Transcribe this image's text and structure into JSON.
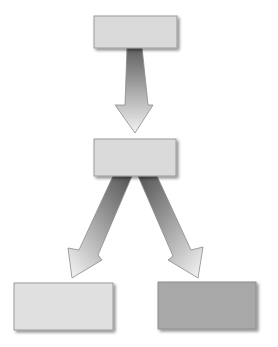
{
  "diagram": {
    "type": "hierarchy-flow",
    "background": "#ffffff",
    "nodes": [
      {
        "id": "top",
        "label": "",
        "x": 94,
        "y": 16,
        "w": 83,
        "h": 32,
        "fill": "#dadada"
      },
      {
        "id": "middle",
        "label": "",
        "x": 94,
        "y": 139,
        "w": 82,
        "h": 37,
        "fill": "#dadada"
      },
      {
        "id": "bottom-left",
        "label": "",
        "x": 14,
        "y": 283,
        "w": 99,
        "h": 47,
        "fill": "#e0e0e0"
      },
      {
        "id": "bottom-right",
        "label": "",
        "x": 158,
        "y": 282,
        "w": 98,
        "h": 47,
        "fill": "#a8a8a8"
      }
    ],
    "edges": [
      {
        "from": "top",
        "to": "middle"
      },
      {
        "from": "middle",
        "to": "bottom-left"
      },
      {
        "from": "middle",
        "to": "bottom-right"
      }
    ],
    "arrow_gradient": {
      "start": "#5e5e5e",
      "end": "#f2f2f2"
    },
    "border_color": "#9a9a9a"
  }
}
